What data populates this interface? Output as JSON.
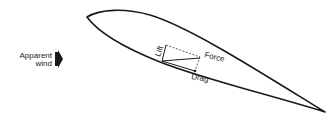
{
  "diagram": {
    "labels": {
      "apparent_wind_line1": "Apparent",
      "apparent_wind_line2": "wind",
      "lift": "Lift",
      "force": "Force",
      "drag": "Drag"
    },
    "colors": {
      "stroke": "#1a1a1a",
      "background": "#ffffff"
    }
  }
}
